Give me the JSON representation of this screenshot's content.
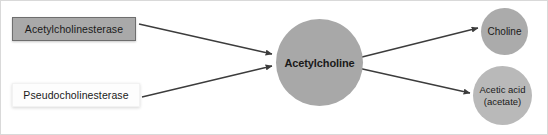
{
  "diagram": {
    "width": 548,
    "height": 135,
    "background_color": "#ffffff",
    "border_color": "#d9d9d9"
  },
  "enzymes": [
    {
      "id": "acetylcholinesterase",
      "label": "Acetylcholinesterase",
      "shape": "rectangle",
      "fill_color": "#a9a9a9",
      "border_color": "#6e6e6e",
      "text_color": "#1a1a1a"
    },
    {
      "id": "pseudocholinesterase",
      "label": "Pseudocholinesterase",
      "shape": "rectangle",
      "fill_color": "#fdfdfd",
      "border_color": "#f2f2f2",
      "text_color": "#1a1a1a"
    }
  ],
  "molecules": [
    {
      "id": "acetylcholine",
      "label": "Acetylcholine",
      "shape": "circle",
      "fill_color": "#a8a8a8",
      "text_color": "#1a1a1a",
      "bold": true
    },
    {
      "id": "choline",
      "label": "Choline",
      "shape": "circle",
      "fill_color": "#ababab",
      "text_color": "#1a1a1a",
      "bold": false
    },
    {
      "id": "acetic-acid",
      "label_line1": "Acetic acid",
      "label_line2": "(acetate)",
      "shape": "circle",
      "fill_color": "#b9b9b9",
      "text_color": "#1a1a1a",
      "bold": false
    }
  ],
  "arrows": [
    {
      "id": "arrow-acetylcholinesterase-to-acetylcholine",
      "from": "acetylcholinesterase",
      "to": "acetylcholine",
      "color": "#3c3c3c"
    },
    {
      "id": "arrow-pseudocholinesterase-to-acetylcholine",
      "from": "pseudocholinesterase",
      "to": "acetylcholine",
      "color": "#3c3c3c"
    },
    {
      "id": "arrow-acetylcholine-to-choline",
      "from": "acetylcholine",
      "to": "choline",
      "color": "#3c3c3c"
    },
    {
      "id": "arrow-acetylcholine-to-acetic-acid",
      "from": "acetylcholine",
      "to": "acetic-acid",
      "color": "#3c3c3c"
    }
  ]
}
